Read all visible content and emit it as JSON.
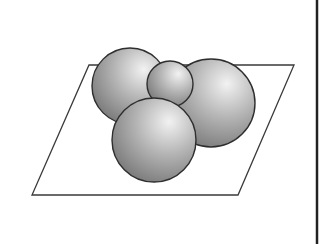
{
  "figure": {
    "plane": {
      "points": [
        [
          89,
          65
        ],
        [
          294,
          65
        ],
        [
          238,
          195
        ],
        [
          32,
          195
        ]
      ],
      "stroke": "#3a3a3a",
      "fill": "#ffffff"
    },
    "spheres": [
      {
        "name": "sphere-back-left",
        "cx": 130,
        "cy": 86,
        "r": 38
      },
      {
        "name": "sphere-back-right",
        "cx": 211,
        "cy": 103,
        "r": 44
      },
      {
        "name": "sphere-small-top",
        "cx": 170,
        "cy": 84,
        "r": 23
      },
      {
        "name": "sphere-front",
        "cx": 154,
        "cy": 140,
        "r": 42
      }
    ],
    "sphere_colors": {
      "highlight": "#f2f2f2",
      "mid": "#b4b4b4",
      "shadow": "#6e6e6e",
      "stroke": "#2e2e2e"
    },
    "edge_line": {
      "x": 317,
      "y1": 0,
      "y2": 244,
      "color": "#222222"
    }
  }
}
